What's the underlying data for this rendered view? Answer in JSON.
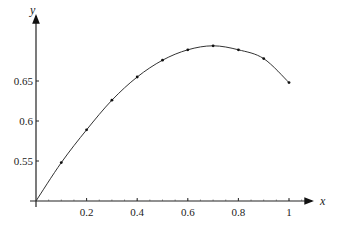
{
  "chart_data": {
    "type": "line",
    "title": "",
    "xlabel": "x",
    "ylabel": "y",
    "xlim": [
      0,
      1.1
    ],
    "ylim": [
      0.5,
      0.72
    ],
    "grid": false,
    "legend": null,
    "x_ticks": [
      "0.2",
      "0.4",
      "0.6",
      "0.8",
      "1"
    ],
    "y_ticks": [
      "0.55",
      "0.6",
      "0.65"
    ],
    "series": [
      {
        "name": "curve",
        "x": [
          0,
          0.1,
          0.2,
          0.3,
          0.4,
          0.5,
          0.6,
          0.7,
          0.8,
          0.9,
          1.0
        ],
        "y": [
          0.5,
          0.548,
          0.589,
          0.626,
          0.655,
          0.676,
          0.689,
          0.694,
          0.689,
          0.678,
          0.648
        ],
        "markers": true
      }
    ]
  }
}
